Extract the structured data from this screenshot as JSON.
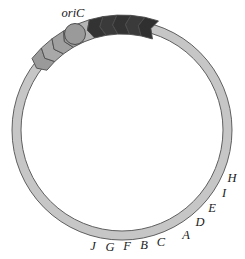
{
  "figure": {
    "name": "circular-chromosome-map",
    "background_color": "#ffffff",
    "description_kind": "diagram"
  },
  "chromosome": {
    "label": "chromosome-ring",
    "center_x": 122,
    "center_y": 130,
    "outer_radius": 110,
    "inner_radius": 101,
    "fill_color": "#c6c6c6",
    "stroke_color": "#5f5f5f",
    "stroke_width": 1
  },
  "origin": {
    "label": "oriC",
    "marker_name": "oric-marker",
    "center_x": 75,
    "center_y": 34,
    "radius": 10.5,
    "fill_color": "#9a9a9a",
    "stroke_color": "#4d4d4d",
    "label_x": 73,
    "label_y": 17
  },
  "legend_colors": {
    "dark_gene": "#333333",
    "medium_gene": "#9a9a9a",
    "light_gene": "#c2c2c2",
    "ring": "#c6c6c6",
    "outline": "#4d4d4d",
    "text": "#1a1a1a"
  },
  "gene_cluster": {
    "name": "gene-arrow-cluster",
    "arrow_direction": "counterclockwise",
    "gene_count": 10,
    "genes": [
      {
        "label": "J",
        "angle_deg": 222,
        "fill": "#9a9a9a",
        "label_x": 93,
        "label_y": 250
      },
      {
        "label": "G",
        "angle_deg": 229,
        "fill": "#a8a8a8",
        "label_x": 110,
        "label_y": 251
      },
      {
        "label": "F",
        "angle_deg": 236,
        "fill": "#a0a0a0",
        "label_x": 127,
        "label_y": 250
      },
      {
        "label": "B",
        "angle_deg": 243,
        "fill": "#9c9c9c",
        "label_x": 144,
        "label_y": 249
      },
      {
        "label": "C",
        "angle_deg": 250,
        "fill": "#b4b4b4",
        "label_x": 161,
        "label_y": 246
      },
      {
        "label": "A",
        "angle_deg": 257,
        "fill": "#333333",
        "label_x": 186,
        "label_y": 239
      },
      {
        "label": "D",
        "angle_deg": 264,
        "fill": "#3a3a3a",
        "label_x": 200,
        "label_y": 226
      },
      {
        "label": "E",
        "angle_deg": 271,
        "fill": "#333333",
        "label_x": 212,
        "label_y": 212
      },
      {
        "label": "I",
        "angle_deg": 278,
        "fill": "#3a3a3a",
        "label_x": 224,
        "label_y": 197
      },
      {
        "label": "H",
        "angle_deg": 285,
        "fill": "#303030",
        "label_x": 232,
        "label_y": 182
      }
    ]
  }
}
